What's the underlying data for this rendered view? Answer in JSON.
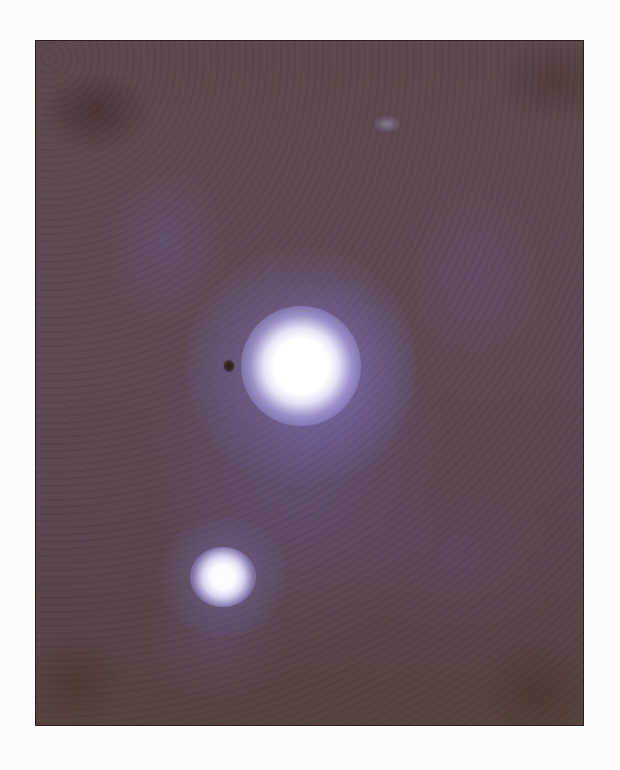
{
  "image": {
    "description": "Astronomical photograph showing two bright star-like sources surrounded by purple diffuse glow on a brownish-purple noisy background",
    "colors": {
      "page_background": "#fdfcfa",
      "sky_background": "#5c4a4c",
      "glow": "#8c7dc8",
      "core": "#ffffff",
      "frame_border": "#2a1f1c"
    },
    "objects": [
      {
        "name": "primary-source",
        "x": 300,
        "y": 365,
        "size": 120
      },
      {
        "name": "secondary-source",
        "x": 222,
        "y": 576,
        "size": 60
      },
      {
        "name": "dark-speck",
        "x": 228,
        "y": 365,
        "size": 12
      },
      {
        "name": "faint-object",
        "x": 386,
        "y": 123,
        "size": 24
      }
    ]
  }
}
